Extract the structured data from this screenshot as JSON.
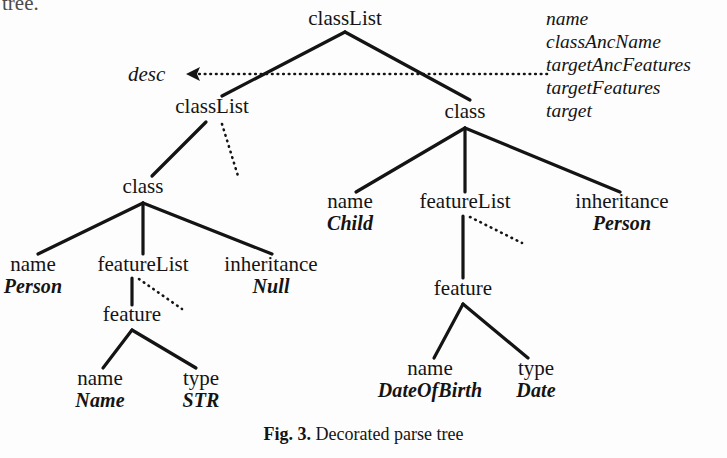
{
  "figure": {
    "caption_number": "Fig. 3.",
    "caption_text": "Decorated parse tree",
    "clipped_text": "tree.",
    "ink_color": "#141414",
    "background_color": "#fdfdfd"
  },
  "annotation": {
    "arrow_label": "desc",
    "attributes": [
      "name",
      "classAncName",
      "targetAncFeatures",
      "targetFeatures",
      "target"
    ]
  },
  "tree": {
    "nodes": [
      {
        "id": "root",
        "label": "classList",
        "value": "",
        "x": 345,
        "y": 22
      },
      {
        "id": "classList2",
        "label": "classList",
        "value": "",
        "x": 212,
        "y": 110
      },
      {
        "id": "class1",
        "label": "class",
        "value": "",
        "x": 143,
        "y": 190
      },
      {
        "id": "name1",
        "label": "name",
        "value": "Person",
        "x": 33,
        "y": 268
      },
      {
        "id": "featList1",
        "label": "featureList",
        "value": "",
        "x": 143,
        "y": 268
      },
      {
        "id": "inherit1",
        "label": "inheritance",
        "value": "Null",
        "x": 271,
        "y": 268
      },
      {
        "id": "feature1",
        "label": "feature",
        "value": "",
        "x": 132,
        "y": 318
      },
      {
        "id": "fname1",
        "label": "name",
        "value": "Name",
        "x": 100,
        "y": 382
      },
      {
        "id": "ftype1",
        "label": "type",
        "value": "STR",
        "x": 201,
        "y": 382
      },
      {
        "id": "class2",
        "label": "class",
        "value": "",
        "x": 465,
        "y": 115
      },
      {
        "id": "name2",
        "label": "name",
        "value": "Child",
        "x": 350,
        "y": 205
      },
      {
        "id": "featList2",
        "label": "featureList",
        "value": "",
        "x": 465,
        "y": 205
      },
      {
        "id": "inherit2",
        "label": "inheritance",
        "value": "Person",
        "x": 622,
        "y": 205
      },
      {
        "id": "feature2",
        "label": "feature",
        "value": "",
        "x": 463,
        "y": 292
      },
      {
        "id": "fname2",
        "label": "name",
        "value": "DateOfBirth",
        "x": 430,
        "y": 372
      },
      {
        "id": "ftype2",
        "label": "type",
        "value": "Date",
        "x": 536,
        "y": 372
      }
    ],
    "solid_edges": [
      {
        "x1": 345,
        "y1": 32,
        "x2": 222,
        "y2": 96
      },
      {
        "x1": 345,
        "y1": 32,
        "x2": 470,
        "y2": 100
      },
      {
        "x1": 206,
        "y1": 122,
        "x2": 152,
        "y2": 176
      },
      {
        "x1": 143,
        "y1": 203,
        "x2": 38,
        "y2": 254
      },
      {
        "x1": 143,
        "y1": 203,
        "x2": 143,
        "y2": 254
      },
      {
        "x1": 143,
        "y1": 203,
        "x2": 272,
        "y2": 254
      },
      {
        "x1": 132,
        "y1": 278,
        "x2": 132,
        "y2": 305
      },
      {
        "x1": 132,
        "y1": 330,
        "x2": 103,
        "y2": 368
      },
      {
        "x1": 132,
        "y1": 330,
        "x2": 196,
        "y2": 368
      },
      {
        "x1": 465,
        "y1": 128,
        "x2": 356,
        "y2": 192
      },
      {
        "x1": 465,
        "y1": 128,
        "x2": 465,
        "y2": 192
      },
      {
        "x1": 465,
        "y1": 128,
        "x2": 620,
        "y2": 192
      },
      {
        "x1": 463,
        "y1": 216,
        "x2": 463,
        "y2": 278
      },
      {
        "x1": 463,
        "y1": 304,
        "x2": 434,
        "y2": 358
      },
      {
        "x1": 463,
        "y1": 304,
        "x2": 528,
        "y2": 358
      }
    ],
    "dotted_edges": [
      {
        "x1": 222,
        "y1": 124,
        "x2": 238,
        "y2": 176
      },
      {
        "x1": 139,
        "y1": 279,
        "x2": 182,
        "y2": 309
      },
      {
        "x1": 470,
        "y1": 217,
        "x2": 522,
        "y2": 243
      }
    ],
    "dotted_arrow": {
      "x1": 547,
      "y1": 74,
      "x2": 186,
      "y2": 74
    }
  }
}
